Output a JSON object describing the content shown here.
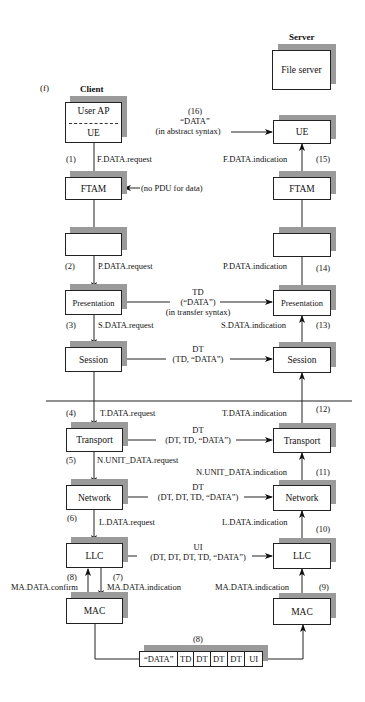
{
  "figure_label": "(f)",
  "client": {
    "title": "Client",
    "user_ap": "User AP",
    "ue": "UE",
    "ftam": "FTAM",
    "empty": "",
    "presentation": "Presentation",
    "session": "Session",
    "transport": "Transport",
    "network": "Network",
    "llc": "LLC",
    "mac": "MAC"
  },
  "server": {
    "title": "Server",
    "file_server": "File server",
    "ue": "UE",
    "ftam": "FTAM",
    "empty": "",
    "presentation": "Presentation",
    "session": "Session",
    "transport": "Transport",
    "network": "Network",
    "llc": "LLC",
    "mac": "MAC"
  },
  "client_primitives": [
    {
      "step": "(1)",
      "label": "F.DATA.request"
    },
    {
      "step": "(2)",
      "label": "P.DATA.request"
    },
    {
      "step": "(3)",
      "label": "S.DATA.request"
    },
    {
      "step": "(4)",
      "label": "T.DATA.request"
    },
    {
      "step": "(5)",
      "label": "N.UNIT_DATA.request"
    },
    {
      "step": "(6)",
      "label": "L.DATA.request"
    },
    {
      "step": "(7)",
      "label": "MA.DATA.indication"
    },
    {
      "step": "(8)",
      "label": "MA.DATA.confirm"
    }
  ],
  "server_primitives": [
    {
      "step": "(9)",
      "label": "MA.DATA.indication"
    },
    {
      "step": "(10)",
      "label": "L.DATA.indication"
    },
    {
      "step": "(11)",
      "label": "N.UNIT_DATA.indication"
    },
    {
      "step": "(12)",
      "label": "T.DATA.indication"
    },
    {
      "step": "(13)",
      "label": "S.DATA.indication"
    },
    {
      "step": "(14)",
      "label": "P.DATA.indication"
    },
    {
      "step": "(15)",
      "label": "F.DATA.indication"
    }
  ],
  "peer_pdus": {
    "application": {
      "step": "(16)",
      "line1": "“DATA”",
      "line2": "(in abstract syntax)"
    },
    "ftam_note": "(no PDU for data)",
    "presentation": {
      "line1": "TD",
      "line2": "(“DATA”)",
      "line3": "(in transfer syntax)"
    },
    "session": {
      "line1": "DT",
      "line2": "(TD, “DATA”)"
    },
    "transport": {
      "line1": "DT",
      "line2": "(DT, TD, “DATA”)"
    },
    "network": {
      "line1": "DT",
      "line2": "(DT, DT, TD, “DATA”)"
    },
    "llc": {
      "line1": "UI",
      "line2": "(DT, DT, DT, TD, “DATA”)"
    }
  },
  "frame": {
    "step": "(8)",
    "cells": [
      "“DATA”",
      "TD",
      "DT",
      "DT",
      "DT",
      "UI"
    ]
  }
}
